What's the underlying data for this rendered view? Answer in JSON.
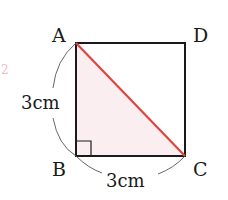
{
  "diagram": {
    "vertices": {
      "A": {
        "label": "A",
        "x": 76,
        "y": 43
      },
      "B": {
        "label": "B",
        "x": 76,
        "y": 156
      },
      "C": {
        "label": "C",
        "x": 185,
        "y": 156
      },
      "D": {
        "label": "D",
        "x": 185,
        "y": 43
      }
    },
    "side_ab_label": "3cm",
    "side_bc_label": "3cm",
    "diagonal": "AC",
    "shaded_region": "triangle ABC",
    "right_angle_at": "B",
    "margin_mark": "2",
    "colors": {
      "outline": "#1a1a1a",
      "diagonal": "#e0443e",
      "shade": "#fbeef0",
      "margin_mark": "#f0b8c4"
    }
  }
}
